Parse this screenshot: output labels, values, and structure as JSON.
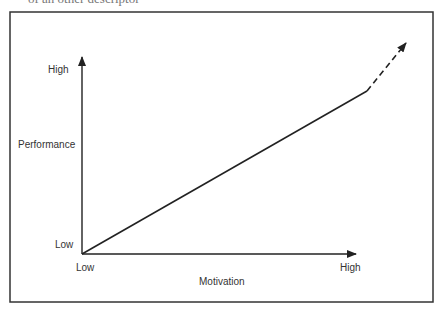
{
  "header": {
    "cut_text": "of an other descriptor"
  },
  "diagram": {
    "y_axis": {
      "label": "Performance",
      "high_label": "High",
      "low_label": "Low"
    },
    "x_axis": {
      "label": "Motivation",
      "high_label": "High",
      "low_label": "Low"
    },
    "line": {
      "style_solid_until": "upper section",
      "style_dashed": "extrapolated extension",
      "direction": "increasing"
    },
    "colors": {
      "stroke": "#222222",
      "frame": "#333333"
    }
  }
}
